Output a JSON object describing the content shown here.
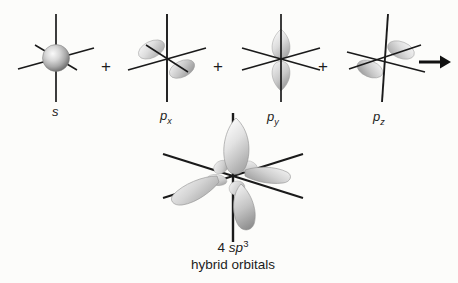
{
  "figure": {
    "background_color": "#fcfcfa",
    "axis_color": "#1a1a1a",
    "lobe_fill_light": "#f2f2f2",
    "lobe_fill_mid": "#c9c9c9",
    "lobe_fill_dark": "#9a9a9a",
    "sphere_highlight": "#f4f4f4",
    "sphere_shadow": "#6e6e6e"
  },
  "reactants": [
    {
      "id": "s",
      "label_plain": "s",
      "label_italic": "s",
      "label_sub": "",
      "orbital_type": "s",
      "icon_name": "s-orbital-icon"
    },
    {
      "id": "px",
      "label_plain": "px",
      "label_italic": "p",
      "label_sub": "x",
      "orbital_type": "p",
      "icon_name": "px-orbital-icon"
    },
    {
      "id": "py",
      "label_plain": "py",
      "label_italic": "p",
      "label_sub": "y",
      "orbital_type": "p",
      "icon_name": "py-orbital-icon"
    },
    {
      "id": "pz",
      "label_plain": "pz",
      "label_italic": "p",
      "label_sub": "z",
      "orbital_type": "p",
      "icon_name": "pz-orbital-icon"
    }
  ],
  "operators": {
    "plus_1": "+",
    "plus_2": "+",
    "plus_3": "+",
    "arrow": "→",
    "arrow_icon_name": "right-arrow-icon"
  },
  "product": {
    "id": "sp3",
    "icon_name": "sp3-hybrid-orbital-icon",
    "caption_line1_count": "4",
    "caption_line1_symbol": "sp",
    "caption_line1_superscript": "3",
    "caption_line2": "hybrid orbitals",
    "lobe_count": 4
  }
}
